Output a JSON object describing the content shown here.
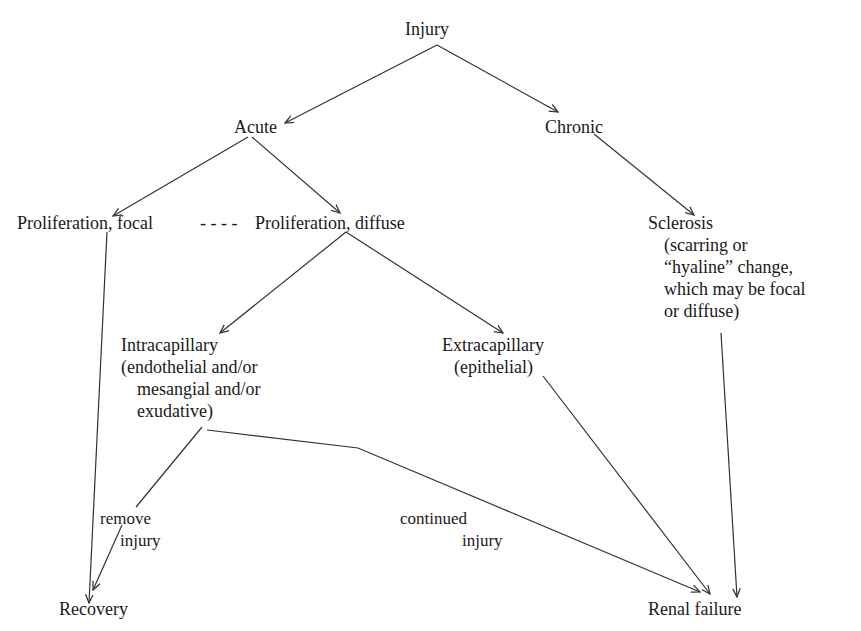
{
  "diagram": {
    "type": "flowchart",
    "nodes": {
      "injury": "Injury",
      "acute": "Acute",
      "chronic": "Chronic",
      "prolif_focal": "Proliferation, focal",
      "dash_link": "- - - -",
      "prolif_diffuse": "Proliferation, diffuse",
      "sclerosis": {
        "title": "Sclerosis",
        "lines": [
          "(scarring or",
          "“hyaline” change,",
          "which may be focal",
          "or diffuse)"
        ]
      },
      "intracapillary": {
        "title": "Intracapillary",
        "lines": [
          "(endothelial and/or",
          "mesangial and/or",
          "exudative)"
        ]
      },
      "extracapillary": {
        "title": "Extracapillary",
        "lines": [
          "(epithelial)"
        ]
      },
      "recovery": "Recovery",
      "renal_failure": "Renal failure"
    },
    "edge_labels": {
      "remove_injury": [
        "remove",
        "injury"
      ],
      "continued_injury": [
        "continued",
        "injury"
      ]
    },
    "edges": [
      {
        "from": "Injury",
        "to": "Acute"
      },
      {
        "from": "Injury",
        "to": "Chronic"
      },
      {
        "from": "Acute",
        "to": "Proliferation, focal"
      },
      {
        "from": "Acute",
        "to": "Proliferation, diffuse"
      },
      {
        "from": "Chronic",
        "to": "Sclerosis"
      },
      {
        "from": "Proliferation, diffuse",
        "to": "Intracapillary"
      },
      {
        "from": "Proliferation, diffuse",
        "to": "Extracapillary"
      },
      {
        "from": "Proliferation, focal",
        "to": "Recovery"
      },
      {
        "from": "Intracapillary",
        "to": "Recovery",
        "label": "remove injury"
      },
      {
        "from": "Intracapillary",
        "to": "Renal failure",
        "label": "continued injury"
      },
      {
        "from": "Extracapillary",
        "to": "Renal failure"
      },
      {
        "from": "Sclerosis",
        "to": "Renal failure"
      }
    ],
    "line_color": "#333333",
    "text_color": "#1a1a1a"
  }
}
